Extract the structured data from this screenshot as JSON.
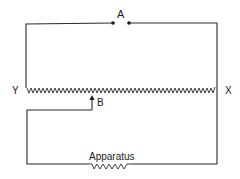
{
  "diagram": {
    "type": "circuit",
    "labels": {
      "a": "A",
      "b": "B",
      "x": "X",
      "y": "Y",
      "apparatus": "Apparatus"
    },
    "components": [
      {
        "id": "terminals-a",
        "kind": "terminal-pair",
        "label": "A"
      },
      {
        "id": "slide-wire",
        "kind": "resistor",
        "ends": [
          "Y",
          "X"
        ]
      },
      {
        "id": "sliding-contact",
        "kind": "slider-arrow",
        "label": "B"
      },
      {
        "id": "apparatus",
        "kind": "resistor",
        "label": "Apparatus"
      }
    ],
    "colors": {
      "line": "#2a2a2a",
      "background": "#ffffff"
    }
  }
}
